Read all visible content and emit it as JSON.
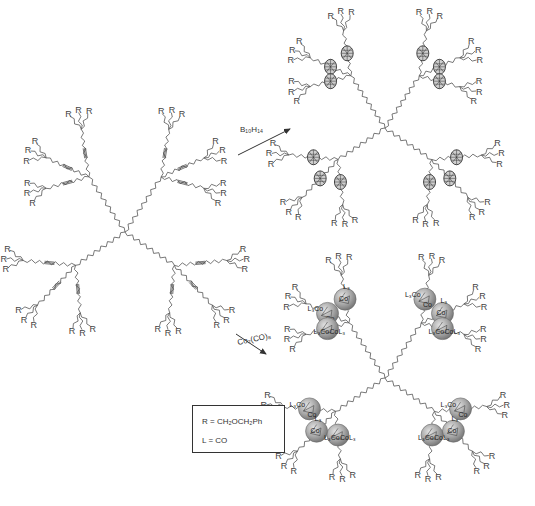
{
  "figure": {
    "type": "reaction-scheme",
    "starting_material": {
      "description": "Dendrimer with internal alkyne (triple bond) linkers and terminal R groups",
      "core_center": [
        125,
        232
      ],
      "terminal_group_label": "R"
    },
    "reactions": [
      {
        "id": "carborane",
        "reagent": "B10H14",
        "reagent_display": "B₁₀H₁₄",
        "product_description": "Carborane-decorated dendrimer",
        "product_center": [
          385,
          128
        ],
        "cage_glyph": "carborane cage"
      },
      {
        "id": "cobalt",
        "reagent": "Co2(CO)8",
        "reagent_display": "Co₂(CO)₈",
        "product_description": "Dicobalt hexacarbonyl-complexed dendrimer",
        "product_center": [
          385,
          378
        ],
        "cluster_labels": [
          "L₃Co",
          "CoL₃",
          "Co"
        ]
      }
    ],
    "legend": {
      "lines": [
        "R = CH₂OCH₂Ph",
        "L = CO"
      ]
    },
    "r_label": "R",
    "co_labels": {
      "left": "L₃Co",
      "right": "CoL₃",
      "mid": "Co",
      "l3": "L₃"
    }
  }
}
